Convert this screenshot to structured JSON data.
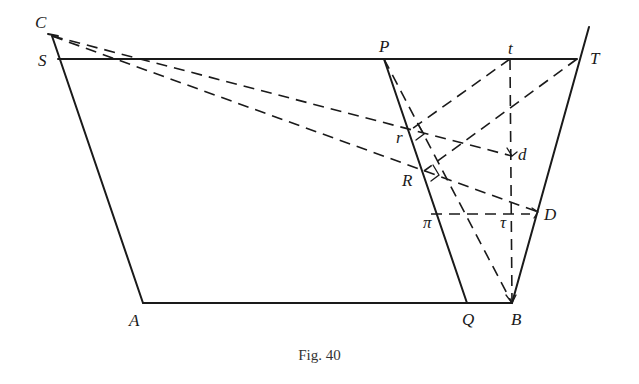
{
  "figure": {
    "caption": "Fig. 40",
    "labels": {
      "C": "C",
      "S": "S",
      "A": "A",
      "P": "P",
      "t": "t",
      "T": "T",
      "r": "r",
      "R": "R",
      "d": "d",
      "D": "D",
      "pi": "π",
      "tau": "τ",
      "Q": "Q",
      "B": "B"
    },
    "points": {
      "C": [
        48,
        34
      ],
      "S": [
        58,
        59
      ],
      "A": [
        143,
        303
      ],
      "P": [
        384,
        59
      ],
      "t": [
        510,
        59
      ],
      "T": [
        577,
        59
      ],
      "T_top": [
        589,
        27
      ],
      "r": [
        409,
        131
      ],
      "R": [
        424,
        171
      ],
      "d": [
        512,
        156
      ],
      "D": [
        538,
        212
      ],
      "pi": [
        431,
        214
      ],
      "tau": [
        510,
        214
      ],
      "Q": [
        467,
        303
      ],
      "B": [
        512,
        303
      ]
    },
    "solid_lines": [
      [
        "S",
        "T"
      ],
      [
        "S",
        "A"
      ],
      [
        "A",
        "B"
      ],
      [
        "P",
        "Q"
      ],
      [
        "B",
        "T_top"
      ]
    ],
    "dashed_lines": [
      [
        "C",
        "S"
      ],
      [
        "C",
        "d"
      ],
      [
        "C",
        "D"
      ],
      [
        "t",
        "r"
      ],
      [
        "T",
        "R"
      ],
      [
        "t",
        "B"
      ],
      [
        "P",
        "B"
      ],
      [
        "pi",
        "tau"
      ]
    ]
  }
}
